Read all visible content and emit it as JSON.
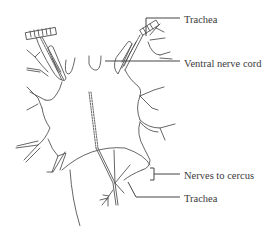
{
  "figure": {
    "type": "anatomical line drawing",
    "colors": {
      "line": "#555555",
      "background": "#ffffff",
      "text": "#3a3a3a"
    }
  },
  "labels": {
    "trachea_top": "Trachea",
    "ventral_nerve_cord": "Ventral nerve cord",
    "nerves_to_cercus": "Nerves to cercus",
    "trachea_bottom": "Trachea"
  }
}
